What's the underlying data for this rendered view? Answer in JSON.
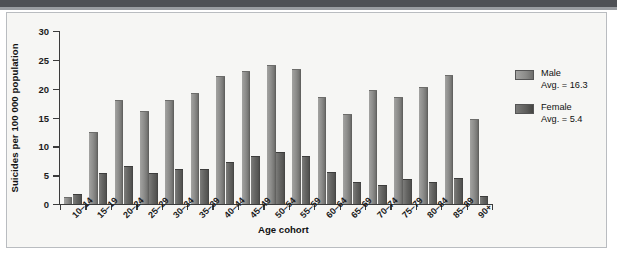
{
  "figure": {
    "background_color": "#f6f6f4",
    "frame_color": "#b9bcc0",
    "scan_band_color": "#4f5155"
  },
  "chart_data": {
    "type": "bar",
    "title": "",
    "xlabel": "Age cohort",
    "ylabel": "Suicides per 100 000 population",
    "ylim": [
      0,
      30
    ],
    "yticks": [
      "0",
      "5",
      "10",
      "15",
      "20",
      "25",
      "30"
    ],
    "grid": false,
    "legend_position": "right",
    "categories": [
      "10–14",
      "15–19",
      "20–24",
      "25–29",
      "30–34",
      "35–39",
      "40–44",
      "45–49",
      "50–54",
      "55–59",
      "60–64",
      "65–69",
      "70–74",
      "75–79",
      "80–84",
      "85–89",
      "90+"
    ],
    "series": [
      {
        "name": "Male",
        "color": "#8d8d8b",
        "average_label": "Avg. = 16.3",
        "average": 16.3,
        "values": [
          1.2,
          12.5,
          18.1,
          16.1,
          18.1,
          19.2,
          22.2,
          23.0,
          24.1,
          23.4,
          18.6,
          15.6,
          19.7,
          18.6,
          20.3,
          22.4,
          14.8
        ]
      },
      {
        "name": "Female",
        "color": "#5e5e5c",
        "average_label": "Avg. = 5.4",
        "average": 5.4,
        "values": [
          1.8,
          5.4,
          6.6,
          5.3,
          6.0,
          6.0,
          7.2,
          8.3,
          9.0,
          8.3,
          5.6,
          3.9,
          3.3,
          4.4,
          3.8,
          4.5,
          1.4
        ]
      }
    ]
  },
  "legend": {
    "entries": [
      {
        "label": "Male",
        "sub": "Avg. = 16.3"
      },
      {
        "label": "Female",
        "sub": "Avg. = 5.4"
      }
    ]
  }
}
